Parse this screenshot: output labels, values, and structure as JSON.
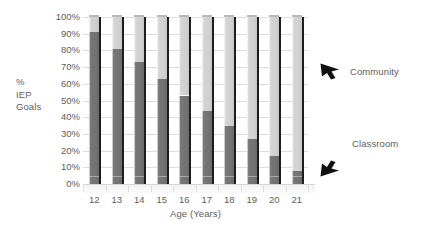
{
  "chart_data": {
    "type": "bar",
    "subtype": "stacked-100-percent",
    "title": "",
    "xlabel": "Age (Years)",
    "ylabel": "% IEP Goals",
    "ylabel_lines": [
      "%",
      "IEP",
      "Goals"
    ],
    "categories": [
      "12",
      "13",
      "14",
      "15",
      "16",
      "17",
      "18",
      "19",
      "20",
      "21"
    ],
    "ylim": [
      0,
      100
    ],
    "ytick_labels": [
      "0%",
      "10%",
      "20%",
      "30%",
      "40%",
      "50%",
      "60%",
      "70%",
      "80%",
      "90%",
      "100%"
    ],
    "ytick_values": [
      0,
      10,
      20,
      30,
      40,
      50,
      60,
      70,
      80,
      90,
      100
    ],
    "grid": true,
    "legend_position": "annotations-right",
    "series": [
      {
        "name": "Classroom",
        "color": "#727272",
        "values": [
          91,
          81,
          73,
          63,
          53,
          44,
          35,
          27,
          17,
          8
        ]
      },
      {
        "name": "Community",
        "color": "#d2d2d2",
        "values": [
          9,
          19,
          27,
          37,
          47,
          56,
          65,
          73,
          83,
          92
        ]
      }
    ],
    "annotations": [
      {
        "label": "Community",
        "icon": "arrow-pointing-left-down",
        "target_series": "Community"
      },
      {
        "label": "Classroom",
        "icon": "arrow-pointing-left-down",
        "target_series": "Classroom"
      }
    ]
  },
  "axes": {
    "y_title_lines": [
      "%",
      "IEP",
      "Goals"
    ],
    "x_title": "Age (Years)"
  },
  "annotations": {
    "community": {
      "label": "Community"
    },
    "classroom": {
      "label": "Classroom"
    }
  },
  "colors": {
    "classroom": "#727272",
    "community": "#d2d2d2",
    "grid": "#dddddd",
    "text": "#5e5e5e",
    "arrow": "#111111"
  }
}
